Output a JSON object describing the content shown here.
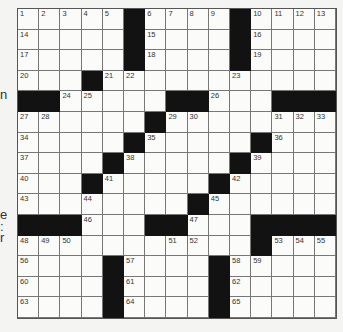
{
  "margin_fragments": [
    {
      "text": "n",
      "top": 87
    },
    {
      "text": "e",
      "top": 207
    },
    {
      "text": ":",
      "top": 219
    },
    {
      "text": "r",
      "top": 230
    }
  ],
  "puzzle": {
    "rows": 15,
    "cols": 15,
    "colors": {
      "black": "#121212",
      "white": "#fbfbf9",
      "line": "#777777"
    },
    "layout": [
      "#####.#####.####",
      "placeholder"
    ],
    "grid": [
      ".....#....#....",
      ".....#....#....",
      ".....#....#....",
      "...#...........",
      "##.....##...###",
      "......#........",
      ".....#.....#...",
      "....#.....#....",
      "...#.....#.....",
      "........#......",
      "###...##...####",
      "...........#...",
      "....#....#.....",
      "....#....#.....",
      "....#....#....."
    ],
    "numbers": [
      {
        "r": 0,
        "c": 0,
        "n": "1"
      },
      {
        "r": 0,
        "c": 1,
        "n": "2"
      },
      {
        "r": 0,
        "c": 2,
        "n": "3"
      },
      {
        "r": 0,
        "c": 3,
        "n": "4"
      },
      {
        "r": 0,
        "c": 4,
        "n": "5"
      },
      {
        "r": 0,
        "c": 6,
        "n": "6"
      },
      {
        "r": 0,
        "c": 7,
        "n": "7"
      },
      {
        "r": 0,
        "c": 8,
        "n": "8"
      },
      {
        "r": 0,
        "c": 9,
        "n": "9"
      },
      {
        "r": 0,
        "c": 11,
        "n": "10"
      },
      {
        "r": 0,
        "c": 12,
        "n": "11"
      },
      {
        "r": 0,
        "c": 13,
        "n": "12"
      },
      {
        "r": 0,
        "c": 14,
        "n": "13"
      },
      {
        "r": 1,
        "c": 0,
        "n": "14"
      },
      {
        "r": 1,
        "c": 6,
        "n": "15"
      },
      {
        "r": 1,
        "c": 11,
        "n": "16"
      },
      {
        "r": 2,
        "c": 0,
        "n": "17"
      },
      {
        "r": 2,
        "c": 6,
        "n": "18"
      },
      {
        "r": 2,
        "c": 11,
        "n": "19"
      },
      {
        "r": 3,
        "c": 0,
        "n": "20"
      },
      {
        "r": 3,
        "c": 4,
        "n": "21"
      },
      {
        "r": 3,
        "c": 5,
        "n": "22"
      },
      {
        "r": 3,
        "c": 10,
        "n": "23"
      },
      {
        "r": 4,
        "c": 2,
        "n": "24"
      },
      {
        "r": 4,
        "c": 3,
        "n": "25"
      },
      {
        "r": 4,
        "c": 9,
        "n": "26"
      },
      {
        "r": 5,
        "c": 0,
        "n": "27"
      },
      {
        "r": 5,
        "c": 1,
        "n": "28"
      },
      {
        "r": 5,
        "c": 7,
        "n": "29"
      },
      {
        "r": 5,
        "c": 8,
        "n": "30"
      },
      {
        "r": 5,
        "c": 12,
        "n": "31"
      },
      {
        "r": 5,
        "c": 13,
        "n": "32"
      },
      {
        "r": 5,
        "c": 14,
        "n": "33"
      },
      {
        "r": 6,
        "c": 0,
        "n": "34"
      },
      {
        "r": 6,
        "c": 6,
        "n": "35"
      },
      {
        "r": 6,
        "c": 12,
        "n": "36"
      },
      {
        "r": 7,
        "c": 0,
        "n": "37"
      },
      {
        "r": 7,
        "c": 5,
        "n": "38"
      },
      {
        "r": 7,
        "c": 11,
        "n": "39"
      },
      {
        "r": 8,
        "c": 0,
        "n": "40"
      },
      {
        "r": 8,
        "c": 4,
        "n": "41"
      },
      {
        "r": 8,
        "c": 10,
        "n": "42"
      },
      {
        "r": 9,
        "c": 0,
        "n": "43"
      },
      {
        "r": 9,
        "c": 3,
        "n": "44"
      },
      {
        "r": 9,
        "c": 9,
        "n": "45"
      },
      {
        "r": 10,
        "c": 3,
        "n": "46"
      },
      {
        "r": 10,
        "c": 8,
        "n": "47"
      },
      {
        "r": 11,
        "c": 0,
        "n": "48"
      },
      {
        "r": 11,
        "c": 1,
        "n": "49"
      },
      {
        "r": 11,
        "c": 2,
        "n": "50"
      },
      {
        "r": 11,
        "c": 7,
        "n": "51"
      },
      {
        "r": 11,
        "c": 8,
        "n": "52"
      },
      {
        "r": 11,
        "c": 12,
        "n": "53"
      },
      {
        "r": 11,
        "c": 13,
        "n": "54"
      },
      {
        "r": 11,
        "c": 14,
        "n": "55"
      },
      {
        "r": 12,
        "c": 0,
        "n": "56"
      },
      {
        "r": 12,
        "c": 5,
        "n": "57"
      },
      {
        "r": 12,
        "c": 10,
        "n": "58"
      },
      {
        "r": 12,
        "c": 11,
        "n": "59"
      },
      {
        "r": 13,
        "c": 0,
        "n": "60"
      },
      {
        "r": 13,
        "c": 5,
        "n": "61"
      },
      {
        "r": 13,
        "c": 10,
        "n": "62"
      },
      {
        "r": 14,
        "c": 0,
        "n": "63"
      },
      {
        "r": 14,
        "c": 5,
        "n": "64"
      },
      {
        "r": 14,
        "c": 10,
        "n": "65"
      }
    ]
  }
}
